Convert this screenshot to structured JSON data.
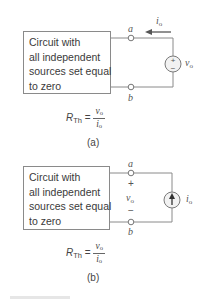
{
  "panels": [
    {
      "id": "a",
      "caption": "(a)",
      "box_lines": [
        "Circuit with",
        "all independent",
        "sources set equal",
        "to zero"
      ],
      "terminal_top": "a",
      "terminal_bottom": "b",
      "source": {
        "type": "voltage-source",
        "plus": "+",
        "minus": "−",
        "label_var": "v",
        "label_sub": "o"
      },
      "current": {
        "label_var": "i",
        "label_sub": "o",
        "direction": "left"
      },
      "equation": {
        "lhs_var": "R",
        "lhs_sub": "Th",
        "equals": "=",
        "num_var": "v",
        "num_sub": "o",
        "den_var": "i",
        "den_sub": "o"
      }
    },
    {
      "id": "b",
      "caption": "(b)",
      "box_lines": [
        "Circuit with",
        "all independent",
        "sources set equal",
        "to zero"
      ],
      "terminal_top": "a",
      "terminal_bottom": "b",
      "voltage_label": {
        "plus": "+",
        "minus": "−",
        "label_var": "v",
        "label_sub": "o"
      },
      "source": {
        "type": "current-source",
        "direction": "up",
        "label_var": "i",
        "label_sub": "o"
      },
      "equation": {
        "lhs_var": "R",
        "lhs_sub": "Th",
        "equals": "=",
        "num_var": "v",
        "num_sub": "o",
        "den_var": "i",
        "den_sub": "o"
      }
    }
  ],
  "colors": {
    "wire": "#8a8a8a",
    "text": "#3a3a3a",
    "source_fill": "#f2f2f2"
  }
}
